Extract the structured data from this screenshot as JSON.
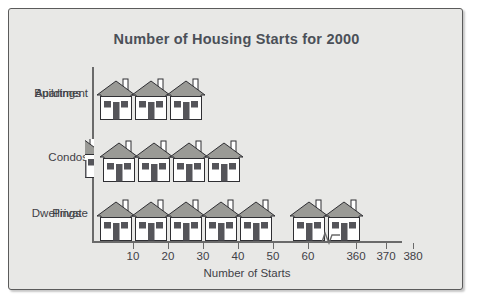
{
  "chart_data": {
    "type": "bar",
    "subtype": "pictograph",
    "title": "Number of Housing Starts for 2000",
    "xlabel": "Number of Starts",
    "ylabel": "",
    "categories": [
      "Apartment Buildings",
      "Condos",
      "Private Dwellings"
    ],
    "values": [
      30,
      43,
      370
    ],
    "series": [
      {
        "name": "Housing Starts",
        "values": [
          30,
          43,
          370
        ]
      }
    ],
    "icon": "house-icon",
    "icon_unit": 10,
    "icon_counts": [
      3,
      4.3,
      7
    ],
    "xticks": [
      10,
      20,
      30,
      40,
      50,
      60,
      360,
      370,
      380
    ],
    "xtick_labels": [
      "10",
      "20",
      "30",
      "40",
      "50",
      "60",
      "360",
      "370",
      "380"
    ],
    "axis_break": true,
    "axis_break_after": 60,
    "axis_break_before": 360,
    "xlim": [
      0,
      380
    ],
    "grid": false,
    "legend": "none"
  },
  "figure": {
    "background_color": "#e8e8e6",
    "border_color": "#5b5b5b",
    "title_color": "#4b5058",
    "axis_color": "#6a6a6a",
    "text_color": "#3f3f46",
    "roof_color": "#9a9a96",
    "wall_color": "#ffffff",
    "door_color": "#55555a",
    "window_color": "#55555a",
    "outline_color": "#2f2f33"
  },
  "rows": [
    {
      "label_line1": "Apartment",
      "label_line2": "Buildings",
      "count": 3,
      "partial": 0
    },
    {
      "label_line1": "Condos",
      "label_line2": "",
      "count": 4,
      "partial": 1
    },
    {
      "label_line1": "Private",
      "label_line2": "Dwellings",
      "count": 7,
      "partial": 0
    }
  ],
  "ticks": [
    {
      "label": "10",
      "x": 124
    },
    {
      "label": "20",
      "x": 159
    },
    {
      "label": "30",
      "x": 194
    },
    {
      "label": "40",
      "x": 229
    },
    {
      "label": "50",
      "x": 264
    },
    {
      "label": "60",
      "x": 299
    },
    {
      "label": "360",
      "x": 347
    },
    {
      "label": "370",
      "x": 377
    },
    {
      "label": "380",
      "x": 404
    }
  ]
}
